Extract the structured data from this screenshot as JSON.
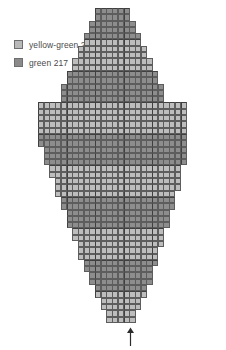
{
  "legend": {
    "items": [
      {
        "swatch": "light",
        "label": "yellow-green 216",
        "color_name": "yellow-green",
        "code": "216",
        "color_hex": "#bdbdbd"
      },
      {
        "swatch": "dark",
        "label": "green 217",
        "color_name": "green",
        "code": "217",
        "color_hex": "#8d8d8d"
      }
    ]
  },
  "marker": {
    "name": "center-arrow",
    "glyph": "↑",
    "position": "bottom-center",
    "meaning": "center of chart"
  },
  "chart_data": {
    "type": "heatmap",
    "title": "",
    "subtitle": "",
    "xlabel": "",
    "ylabel": "",
    "grid": true,
    "legend_position": "top-left",
    "cell_size_px": 6.3,
    "origin_px": {
      "x": 38,
      "y": 8
    },
    "palette": {
      "216": "#bdbdbd",
      "217": "#8d8d8d",
      "empty": null
    },
    "categories": [
      "216",
      "217"
    ],
    "legend_entries": [
      "yellow-green 216",
      "green 217"
    ],
    "annotations": [
      {
        "type": "arrow",
        "direction": "up",
        "x_col": 14,
        "label": "",
        "note": "center marker at bottom"
      }
    ],
    "columns": 26,
    "rows": 50,
    "row_colors": [
      "217",
      "217",
      "217",
      "217",
      "217",
      "216",
      "216",
      "216",
      "216",
      "216",
      "217",
      "217",
      "217",
      "217",
      "217",
      "216",
      "216",
      "216",
      "216",
      "216",
      "217",
      "217",
      "217",
      "217",
      "217",
      "216",
      "216",
      "216",
      "216",
      "216",
      "217",
      "217",
      "217",
      "217",
      "217",
      "216",
      "216",
      "216",
      "216",
      "216",
      "217",
      "217",
      "217",
      "217",
      "217",
      "216",
      "216",
      "216",
      "216",
      "216"
    ],
    "row_spans": [
      [
        10,
        16
      ],
      [
        10,
        16
      ],
      [
        9,
        17
      ],
      [
        9,
        17
      ],
      [
        8,
        18
      ],
      [
        8,
        18
      ],
      [
        7,
        19
      ],
      [
        7,
        19
      ],
      [
        6,
        20
      ],
      [
        6,
        20
      ],
      [
        5,
        21
      ],
      [
        5,
        21
      ],
      [
        4,
        22
      ],
      [
        4,
        22
      ],
      [
        4,
        22
      ],
      [
        0,
        26
      ],
      [
        0,
        26
      ],
      [
        0,
        26
      ],
      [
        0,
        26
      ],
      [
        0,
        26
      ],
      [
        0,
        26
      ],
      [
        0,
        26
      ],
      [
        1,
        26
      ],
      [
        1,
        26
      ],
      [
        1,
        26
      ],
      [
        2,
        25
      ],
      [
        2,
        25
      ],
      [
        3,
        25
      ],
      [
        3,
        25
      ],
      [
        3,
        24
      ],
      [
        4,
        24
      ],
      [
        4,
        24
      ],
      [
        5,
        23
      ],
      [
        5,
        23
      ],
      [
        5,
        23
      ],
      [
        6,
        22
      ],
      [
        6,
        22
      ],
      [
        7,
        22
      ],
      [
        7,
        21
      ],
      [
        7,
        21
      ],
      [
        8,
        21
      ],
      [
        8,
        20
      ],
      [
        9,
        20
      ],
      [
        9,
        20
      ],
      [
        10,
        19
      ],
      [
        10,
        19
      ],
      [
        11,
        18
      ],
      [
        11,
        18
      ],
      [
        12,
        17
      ],
      [
        12,
        17
      ]
    ]
  }
}
